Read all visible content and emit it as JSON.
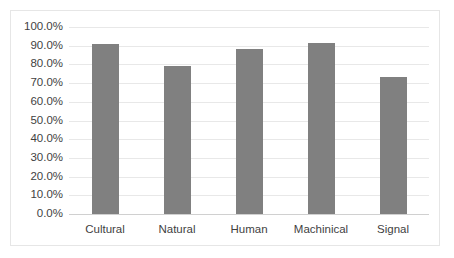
{
  "chart_data": {
    "type": "bar",
    "title": "",
    "subtitle": "",
    "xlabel": "",
    "ylabel": "",
    "categories": [
      "Cultural",
      "Natural",
      "Human",
      "Machinical",
      "Signal"
    ],
    "values": [
      90.8,
      79.2,
      88.0,
      91.4,
      73.5
    ],
    "series": [
      {
        "name": "",
        "values": [
          90.8,
          79.2,
          88.0,
          91.4,
          73.5
        ]
      }
    ],
    "ylim": [
      0,
      100
    ],
    "ytick_values": [
      0,
      10,
      20,
      30,
      40,
      50,
      60,
      70,
      80,
      90,
      100
    ],
    "ytick_labels": [
      "0.0%",
      "10.0%",
      "20.0%",
      "30.0%",
      "40.0%",
      "50.0%",
      "60.0%",
      "70.0%",
      "80.0%",
      "90.0%",
      "100.0%"
    ],
    "grid": true,
    "legend": false,
    "legend_position": "none",
    "bar_color": "#808080",
    "gridline_color": "#e8e8e8",
    "border_color": "#e6e6e6",
    "background_color": "#ffffff",
    "text_color": "#3f3f3f"
  }
}
